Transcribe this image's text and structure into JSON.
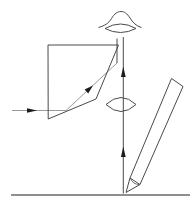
{
  "canvas": {
    "width": 192,
    "height": 208,
    "background": "#ffffff"
  },
  "colors": {
    "outline": "#4a4a4a",
    "ray": "#9a9a9a",
    "arrow": "#1c1c1c",
    "ground": "#8f8f8f"
  },
  "diagram": {
    "kind": "optics-schematic-camera-lucida",
    "shapes": [
      {
        "name": "ground-line",
        "type": "line",
        "attrs": {
          "x1": 11,
          "y1": 195,
          "x2": 190,
          "y2": 195
        },
        "color": "ground",
        "w": 2
      },
      {
        "name": "object-ray-horizontal",
        "type": "line",
        "attrs": {
          "x1": 12,
          "y1": 110.5,
          "x2": 66,
          "y2": 110.5
        },
        "color": "ray",
        "w": 1
      },
      {
        "name": "object-ray-arrow",
        "type": "polygon",
        "attrs": {
          "points": "37,110.5 27,108.2 27,112.8"
        },
        "color": "arrow",
        "fill": true
      },
      {
        "name": "refracted-ray-diagonal",
        "type": "line",
        "attrs": {
          "x1": 66,
          "y1": 110.5,
          "x2": 117,
          "y2": 63
        },
        "color": "ray",
        "w": 1
      },
      {
        "name": "refracted-ray-arrow",
        "type": "polygon",
        "attrs": {
          "points": "93,85.4 88.2,93.4 84.6,89.6"
        },
        "color": "arrow",
        "fill": true
      },
      {
        "name": "exit-ray-vertical",
        "type": "line",
        "attrs": {
          "x1": 117,
          "y1": 63,
          "x2": 117,
          "y2": 38.5
        },
        "color": "outline",
        "w": 1
      },
      {
        "name": "optical-axis-vertical",
        "type": "line",
        "attrs": {
          "x1": 123.3,
          "y1": 193.5,
          "x2": 123.3,
          "y2": 37
        },
        "color": "outline",
        "w": 1
      },
      {
        "name": "axis-arrow-upper",
        "type": "polygon",
        "attrs": {
          "points": "123.3,66.5 120.9,77 125.7,77"
        },
        "color": "arrow",
        "fill": true
      },
      {
        "name": "axis-arrow-lower",
        "type": "polygon",
        "attrs": {
          "points": "123.3,146.5 120.9,157 125.7,157"
        },
        "color": "arrow",
        "fill": true
      },
      {
        "name": "prism-outline",
        "type": "polygon",
        "attrs": {
          "points": "48,45 118.5,45 96,99 48.2,119"
        },
        "color": "outline",
        "w": 1
      },
      {
        "name": "lens-biconvex",
        "type": "path",
        "attrs": {
          "d": "M 106,104.5 Q 121,90.5 136,104.5 Q 121,118.5 106,104.5 Z"
        },
        "color": "outline",
        "w": 1
      },
      {
        "name": "eye-eyelid-curve",
        "type": "path",
        "attrs": {
          "d": "M 98.5,27.5 C 105,25.5 108.5,23.5 111.5,18.5 C 114.5,13.5 117.5,11.5 121,11.5 C 124.5,11.5 127,13.5 130,18 C 133,22.5 136,26 141.5,27.5"
        },
        "color": "outline",
        "w": 1
      },
      {
        "name": "eye-lens-shape",
        "type": "path",
        "attrs": {
          "d": "M 105,28.5 Q 120.5,19.5 136,28.5 Q 120.5,36.5 105,28.5 Z"
        },
        "color": "outline",
        "w": 1
      },
      {
        "name": "pencil-body",
        "type": "polygon",
        "attrs": {
          "points": "130,178 171.5,78.5 183,86.5 140,184.5"
        },
        "color": "outline",
        "w": 1
      },
      {
        "name": "pencil-cone-tip",
        "type": "polyline",
        "attrs": {
          "points": "130,178 126,192.5 140,184.5"
        },
        "color": "outline",
        "w": 1
      },
      {
        "name": "pencil-collar-arc",
        "type": "path",
        "attrs": {
          "d": "M 130.5,178.5 Q 133,184.5 139.5,184.5"
        },
        "color": "outline",
        "w": 0.8
      }
    ]
  }
}
